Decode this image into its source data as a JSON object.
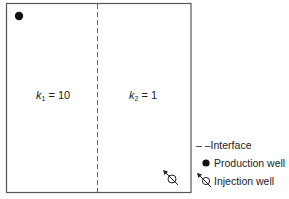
{
  "diagram": {
    "regions": [
      {
        "symbol": "k",
        "subscript": "1",
        "equals": " = ",
        "value": "10"
      },
      {
        "symbol": "k",
        "subscript": "2",
        "equals": " = ",
        "value": "1"
      }
    ],
    "legend": {
      "interface_marker": "– –",
      "interface": "Interface",
      "production": "Production well",
      "injection": "Injection well"
    },
    "colors": {
      "border": "#555555",
      "dash": "#666666",
      "well": "#111111"
    }
  }
}
